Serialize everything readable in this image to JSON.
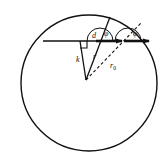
{
  "figure": {
    "background_color": "#ffffff",
    "stroke_color": "#111111",
    "canvas": {
      "width": 168,
      "height": 168
    }
  },
  "chart_data": {
    "type": "diagram",
    "title": "",
    "shapes": [
      {
        "name": "outer-circle",
        "kind": "circle",
        "center": [
          89,
          83
        ],
        "radius": 68,
        "style": "solid",
        "fill": "none"
      },
      {
        "name": "horizontal-baseline",
        "kind": "line",
        "from": [
          43,
          41
        ],
        "to": [
          112,
          41
        ],
        "style": "solid"
      },
      {
        "name": "vertical-segment-k",
        "kind": "line",
        "from": [
          80,
          41
        ],
        "to": [
          86,
          80
        ],
        "style": "solid"
      },
      {
        "name": "right-angle-marker",
        "kind": "square-marker",
        "at": [
          80,
          41
        ],
        "size": 7
      },
      {
        "name": "ray-r-solid",
        "kind": "line",
        "from": [
          86,
          80
        ],
        "to": [
          110,
          17
        ],
        "style": "solid"
      },
      {
        "name": "ray-r0-dashed",
        "kind": "line",
        "from": [
          86,
          80
        ],
        "to": [
          141,
          23
        ],
        "style": "dashed"
      },
      {
        "name": "arrow-first",
        "kind": "arrow",
        "from": [
          96,
          41
        ],
        "to": [
          122,
          41
        ],
        "style": "solid"
      },
      {
        "name": "arrow-second",
        "kind": "arrow",
        "from": [
          124,
          41
        ],
        "to": [
          149,
          41
        ],
        "style": "solid"
      },
      {
        "name": "angle-arc-first",
        "kind": "arc",
        "center": [
          100,
          41
        ],
        "radius": 13,
        "style": "solid"
      },
      {
        "name": "angle-arc-second",
        "kind": "arc",
        "center": [
          128,
          41
        ],
        "radius": 13,
        "style": "solid"
      }
    ],
    "labels": [
      {
        "name": "label-d",
        "text": "d",
        "sub": "",
        "x": 92,
        "y": 38
      },
      {
        "name": "label-phi-1",
        "text": "φ",
        "sub": "",
        "x": 104,
        "y": 36
      },
      {
        "name": "label-phi-2",
        "text": "φ",
        "sub": "",
        "x": 133,
        "y": 36
      },
      {
        "name": "label-k",
        "text": "k",
        "sub": "",
        "x": 76,
        "y": 62
      },
      {
        "name": "label-r",
        "text": "r",
        "sub": "",
        "x": 93,
        "y": 59
      },
      {
        "name": "label-r0",
        "text": "r",
        "sub": "0",
        "x": 110,
        "y": 68
      }
    ]
  }
}
